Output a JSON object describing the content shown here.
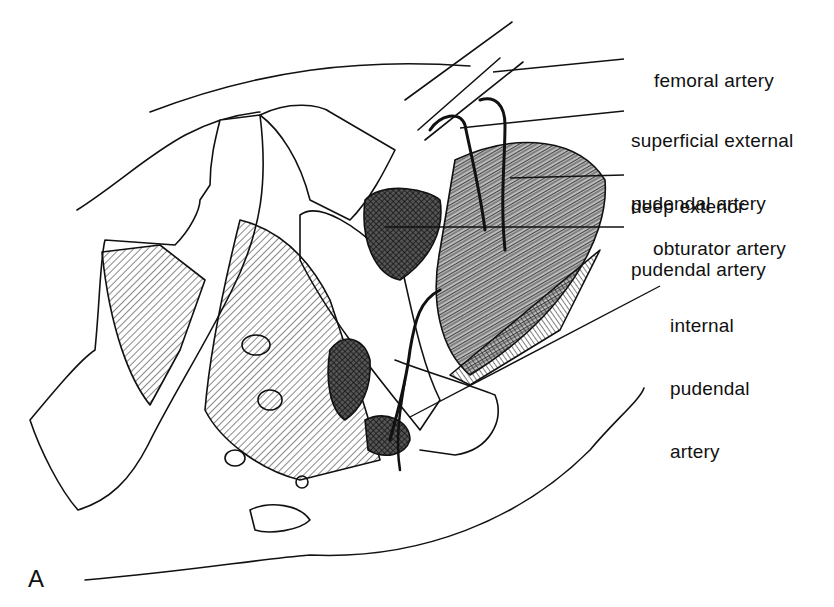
{
  "figure": {
    "panel_letter": "A",
    "colors": {
      "ink": "#111111",
      "background": "#ffffff"
    },
    "labels": [
      {
        "id": "femoral-artery",
        "text": "femoral artery",
        "line1": "femoral artery",
        "line2": ""
      },
      {
        "id": "superficial-external-pudendal-artery",
        "line1": "superficial external",
        "line2": "pudendal artery"
      },
      {
        "id": "deep-exterior-pudendal-artery",
        "line1": "deep exterior",
        "line2": "pudendal artery"
      },
      {
        "id": "obturator-artery",
        "line1": "obturator artery",
        "line2": ""
      },
      {
        "id": "internal-pudendal-artery",
        "line1": "internal",
        "line2": "pudendal",
        "line3": "artery"
      }
    ]
  }
}
